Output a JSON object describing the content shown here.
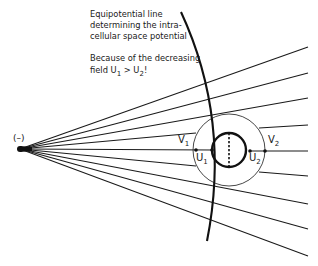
{
  "annotation": {
    "line1": "Equipotential line",
    "line2": "determining the intra-",
    "line3": "cellular space potential",
    "line4": "Because of the decreasing",
    "line5_prefix": "field U",
    "line5_sub1": "1",
    "line5_mid": " > U",
    "line5_sub2": "2",
    "line5_suffix": "!"
  },
  "source_label": "(–)",
  "symbols": {
    "V1": {
      "base": "V",
      "sub": "1"
    },
    "U1": {
      "base": "U",
      "sub": "1"
    },
    "U2": {
      "base": "U",
      "sub": "2"
    },
    "V2": {
      "base": "V",
      "sub": "2"
    }
  },
  "colors": {
    "ink": "#1a1a1a",
    "background": "#ffffff"
  }
}
